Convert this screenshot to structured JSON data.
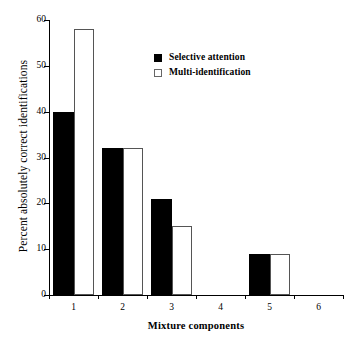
{
  "chart_data": {
    "type": "bar",
    "title": "",
    "subtitle": "",
    "xlabel": "Mixture components",
    "ylabel": "Percent absolutely correct identifications",
    "categories": [
      "1",
      "2",
      "3",
      "4",
      "5",
      "6"
    ],
    "series": [
      {
        "name": "Selective attention",
        "style": "filled",
        "color": "#000000",
        "values": [
          40,
          32,
          21,
          0,
          9,
          0
        ]
      },
      {
        "name": "Multi-identification",
        "style": "open",
        "color": "#ffffff",
        "values": [
          58,
          32,
          15,
          0,
          9,
          0
        ]
      }
    ],
    "ylim": [
      0,
      60
    ],
    "yticks": [
      0,
      10,
      20,
      30,
      40,
      50,
      60
    ],
    "ytick_labels": [
      "0",
      "10",
      "20",
      "30",
      "40",
      "50",
      "60"
    ],
    "grid": false,
    "legend_position": "top-center"
  },
  "legend": {
    "entries": [
      {
        "label": "Selective attention",
        "swatch": "filled-square-icon"
      },
      {
        "label": "Multi-identification",
        "swatch": "open-square-icon"
      }
    ]
  }
}
